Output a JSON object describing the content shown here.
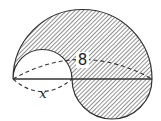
{
  "figure": {
    "labels": {
      "large_arc_label": "8",
      "small_arc_label": "x"
    },
    "colors": {
      "stroke": "#333333",
      "hatch": "#555555",
      "fill_background": "#ffffff"
    }
  }
}
